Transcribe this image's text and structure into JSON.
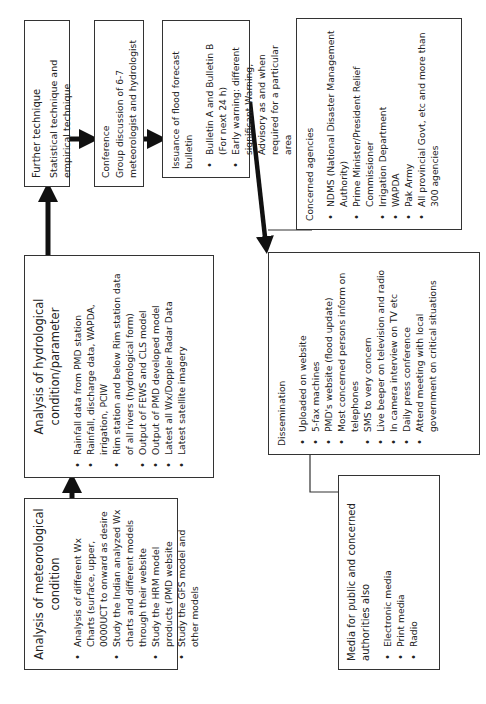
{
  "diagram": {
    "met_analysis": {
      "title": "Analysis of meteorological condition",
      "items": [
        "Analysis of different Wx Charts (surface, upper, 0000UCT to onward as desire",
        "Study the Indian analyzed Wx charts and different models through their website",
        "Study the HRM model products (PMD website",
        "Study the GFS model and other models"
      ]
    },
    "hydro_analysis": {
      "title": "Analysis of hydrological condition/parameter",
      "items": [
        "Rainfall data from PMD station",
        "Rainfall, discharge data, WAPDA, irrigation, PCIW",
        "Rim station and below Rim station data of all rivers (hydrological form)",
        "Output of FEWS and CLS model",
        "Output of PMD developed model",
        "Latest all Wx/Doppler Radar Data",
        "Latest satellite imagery"
      ]
    },
    "further_technique": {
      "title": "Further technique",
      "text": "Statistical technique and empirical technique"
    },
    "conference": {
      "title": "Conference",
      "text": "Group discussion of 6-7 meteorologist and hydrologist"
    },
    "issuance": {
      "title": "Issuance of flood forecast bulletin",
      "items": [
        "Bulletin A and Bulletin B (For next 24 h)",
        "Early warning: different significant Warning, Advisory as and when required for a particular area"
      ]
    },
    "dissemination": {
      "title": "Dissemination",
      "items": [
        "Uploaded on website",
        "5-fax machines",
        "PMD's website (flood update)",
        "Most concerned persons inform on telephones",
        "SMS to very concern",
        "Live beeper on television and radio",
        "In camera interview on TV etc",
        "Daily press conference",
        "Attend meeting with local government on critical situations"
      ]
    },
    "agencies": {
      "title": "Concerned agencies",
      "items": [
        "NDMS (National Disaster Management Authority)",
        "Prime Minister/President Relief Commissioner",
        "Irrigation Department",
        "WAPDA",
        "Pak Army",
        "All provincial Govt, etc and more than 300 agencies"
      ]
    },
    "media": {
      "title": "Media for public and concerned authorities also",
      "items": [
        "Electronic media",
        "Print media",
        "Radio"
      ]
    },
    "colors": {
      "line": "#333333",
      "arrow": "#111111",
      "background": "#ffffff"
    }
  }
}
